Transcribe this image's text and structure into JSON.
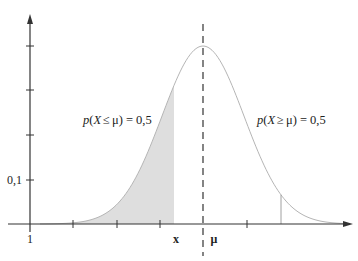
{
  "chart_data": {
    "type": "line",
    "title": "",
    "xlabel": "",
    "ylabel": "",
    "x_tick_labels": [
      {
        "label": "1",
        "position": "origin"
      },
      {
        "label": "x",
        "position": "end of shaded area"
      },
      {
        "label": "μ",
        "position": "mean (dashed line)"
      }
    ],
    "y_tick_labels": [
      {
        "label": "0,1",
        "value": 0.1
      }
    ],
    "annotations": [
      {
        "id": "left",
        "text_p": "p",
        "text_open": "(",
        "text_X": "X",
        "text_rel": " ≤ ",
        "text_mu": "μ",
        "text_close": ") = 0,5"
      },
      {
        "id": "right",
        "text_p": "p",
        "text_open": "(",
        "text_X": "X",
        "text_rel": " ≥ ",
        "text_mu": "μ",
        "text_close": ") = 0,5"
      }
    ],
    "curve": {
      "shape": "gaussian",
      "peak_at": "μ",
      "line_color": "#b0b0b0"
    },
    "shaded_region": {
      "from": "-inf",
      "to": "x",
      "fill": "#dcdcdc"
    },
    "mean_line": {
      "style": "dashed",
      "color": "#333333"
    },
    "marker_line": {
      "style": "solid",
      "position": "right tail",
      "color": "#999999"
    },
    "grid": false,
    "legend": null
  },
  "labels": {
    "origin": "1",
    "y_tick": "0,1",
    "x_mark": "x",
    "mu_mark": "μ",
    "left_p": "p",
    "left_open": "(",
    "left_X": "X",
    "left_rel": "≤",
    "left_mu": "μ",
    "left_close": ") = 0,5",
    "right_p": "p",
    "right_open": "(",
    "right_X": "X",
    "right_rel": "≥",
    "right_mu": "μ",
    "right_close": ") = 0,5"
  }
}
